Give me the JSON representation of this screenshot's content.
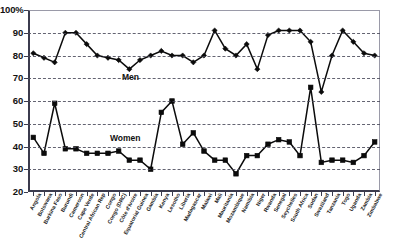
{
  "chart_data": {
    "type": "line",
    "title": "",
    "xlabel": "",
    "ylabel": "",
    "ylim": [
      20,
      100
    ],
    "ytick_labels": [
      "100%",
      "90",
      "80",
      "70",
      "60",
      "50",
      "40",
      "30",
      "20"
    ],
    "ytick_values": [
      100,
      90,
      80,
      70,
      60,
      50,
      40,
      30,
      20
    ],
    "grid": "horizontal-dashed",
    "legend": "inline-annotations",
    "annotations": [
      {
        "text": "Men",
        "near_series": "Men"
      },
      {
        "text": "Women",
        "near_series": "Women"
      }
    ],
    "categories": [
      "Angola",
      "Botswana",
      "Burkina Faso",
      "Burundi",
      "Cameroon",
      "Cape Verde",
      "Central African Rep",
      "Congo",
      "Congo (DRC)",
      "Côte d'Ivoire",
      "Equatorial Guinea",
      "Gambia",
      "Kenya",
      "Lesotho",
      "Liberia",
      "Madagascar",
      "Malawi",
      "Mali",
      "Mauritania",
      "Mozambique",
      "Namibia",
      "Niger",
      "Rwanda",
      "Senegal",
      "Seychelles",
      "South Africa",
      "Sudan",
      "Swaziland",
      "Tanzania",
      "Togo",
      "Uganda",
      "Zambia",
      "Zimbabwe"
    ],
    "series": [
      {
        "name": "Men",
        "marker": "diamond",
        "values": [
          81,
          79,
          77,
          90,
          90,
          85,
          80,
          79,
          78,
          74,
          78,
          80,
          82,
          80,
          80,
          77,
          80,
          91,
          83,
          80,
          85,
          74,
          89,
          91,
          91,
          91,
          86,
          64,
          80,
          91,
          86,
          81,
          80
        ]
      },
      {
        "name": "Women",
        "marker": "square",
        "values": [
          44,
          37,
          59,
          39,
          39,
          37,
          37,
          37,
          38,
          34,
          34,
          30,
          55,
          60,
          41,
          46,
          38,
          34,
          34,
          28,
          36,
          36,
          41,
          43,
          42,
          36,
          66,
          33,
          34,
          34,
          33,
          36,
          42
        ]
      }
    ]
  }
}
